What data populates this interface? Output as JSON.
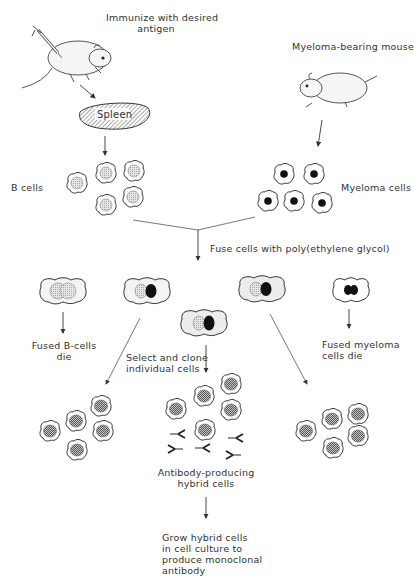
{
  "diagram": {
    "type": "process-flow",
    "topic": "Monoclonal antibody production (hybridoma technique)",
    "labels": {
      "immunize": "Immunize with desired\nantigen",
      "myeloma_mouse": "Myeloma-bearing mouse",
      "spleen": "Spleen",
      "b_cells": "B cells",
      "myeloma_cells": "Myeloma cells",
      "fuse": "Fuse cells with poly(ethylene glycol)",
      "fused_b_die": "Fused B-cells\ndie",
      "fused_myeloma_die": "Fused myeloma\ncells die",
      "select_clone": "Select and clone\nindividual cells",
      "antibody_producing": "Antibody-producing\nhybrid cells",
      "grow": "Grow hybrid cells\nin cell culture to\nproduce monoclonal\nantibody"
    },
    "nodes": [
      {
        "id": "immunized-mouse",
        "kind": "illustration"
      },
      {
        "id": "myeloma-mouse",
        "kind": "illustration"
      },
      {
        "id": "spleen",
        "kind": "organ"
      },
      {
        "id": "b-cells",
        "kind": "cell-cluster",
        "count": 5
      },
      {
        "id": "myeloma-cells",
        "kind": "cell-cluster",
        "count": 5
      },
      {
        "id": "fused-b-b",
        "kind": "fused-cell"
      },
      {
        "id": "hybrid-1",
        "kind": "fused-cell"
      },
      {
        "id": "hybrid-2",
        "kind": "fused-cell"
      },
      {
        "id": "hybrid-3",
        "kind": "fused-cell"
      },
      {
        "id": "fused-m-m",
        "kind": "fused-cell"
      },
      {
        "id": "clone-left",
        "kind": "cell-cluster",
        "count": 5
      },
      {
        "id": "clone-center",
        "kind": "cell-cluster",
        "count": 6
      },
      {
        "id": "clone-right",
        "kind": "cell-cluster",
        "count": 5
      },
      {
        "id": "antibodies",
        "kind": "antibody-set",
        "count": 6
      },
      {
        "id": "culture",
        "kind": "text-step"
      }
    ],
    "edges": [
      [
        "immunized-mouse",
        "spleen"
      ],
      [
        "spleen",
        "b-cells"
      ],
      [
        "myeloma-mouse",
        "myeloma-cells"
      ],
      [
        "b-cells",
        "fuse"
      ],
      [
        "myeloma-cells",
        "fuse"
      ],
      [
        "fused-b-b",
        "die"
      ],
      [
        "fused-m-m",
        "die"
      ],
      [
        "hybrid-1",
        "clone-left"
      ],
      [
        "hybrid-2",
        "clone-center"
      ],
      [
        "hybrid-3",
        "clone-right"
      ],
      [
        "clone-center",
        "culture"
      ]
    ],
    "colors": {
      "ink": "#2a2a2a",
      "b_nucleus": "#d8d8d8",
      "myeloma_nucleus": "#111111",
      "hybrid_nucleus": "#9a9a9a"
    }
  }
}
